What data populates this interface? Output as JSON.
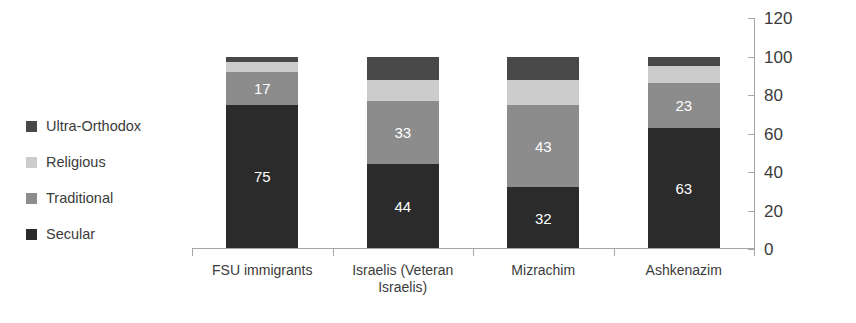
{
  "chart_data": {
    "type": "bar",
    "subtype": "stacked-bar-100",
    "title": "",
    "xlabel": "",
    "ylabel": "",
    "ylim": [
      0,
      120
    ],
    "ytick_step": 20,
    "yticks": [
      "0",
      "20",
      "40",
      "60",
      "80",
      "100",
      "120"
    ],
    "y_axis_position": "right",
    "grid": false,
    "legend_position": "left",
    "categories": [
      "FSU immigrants",
      "Israelis (Veteran Israelis)",
      "Mizrachim",
      "Ashkenazim"
    ],
    "series": [
      {
        "name": "Secular",
        "color": "#2b2b2b",
        "values": [
          75,
          44,
          32,
          63
        ],
        "labels": [
          "75",
          "44",
          "32",
          "63"
        ]
      },
      {
        "name": "Traditional",
        "color": "#8c8c8c",
        "values": [
          17,
          33,
          43,
          23
        ],
        "labels": [
          "17",
          "33",
          "43",
          "23"
        ]
      },
      {
        "name": "Religious",
        "color": "#cccccc",
        "values": [
          5,
          11,
          13,
          9
        ],
        "labels": [
          "",
          "",
          "",
          ""
        ]
      },
      {
        "name": "Ultra-Orthodox",
        "color": "#484848",
        "values": [
          3,
          12,
          12,
          5
        ],
        "labels": [
          "",
          "",
          "",
          ""
        ]
      }
    ]
  },
  "legend": {
    "items": [
      {
        "label": "Ultra-Orthodox",
        "color": "#484848",
        "swatch": "legend-swatch-ultra-orthodox"
      },
      {
        "label": "Religious",
        "color": "#cccccc",
        "swatch": "legend-swatch-religious"
      },
      {
        "label": "Traditional",
        "color": "#8c8c8c",
        "swatch": "legend-swatch-traditional"
      },
      {
        "label": "Secular",
        "color": "#2b2b2b",
        "swatch": "legend-swatch-secular"
      }
    ]
  },
  "axis": {
    "y_labels": [
      "120",
      "100",
      "80",
      "60",
      "40",
      "20",
      "0"
    ],
    "axis_color": "#a6a6a6"
  },
  "colors": {
    "background": "#ffffff",
    "text": "#3b3b3b",
    "data_label": "#ffffff",
    "secular": "#2b2b2b",
    "traditional": "#8c8c8c",
    "religious": "#cccccc",
    "ultra_orthodox": "#484848"
  }
}
